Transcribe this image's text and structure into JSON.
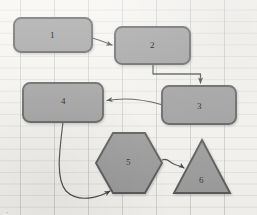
{
  "diagram": {
    "background": {
      "paper_color": "#f6f5f1",
      "grid_major_color": "#7887 96",
      "grid_vertical_spacing_px": 34,
      "grid_horizontal_spacing_px": 11.6
    },
    "style": {
      "shape_fill": "#9a9a9a",
      "shape_stroke": "#575757",
      "connector_stroke": "#4a4a4a",
      "label_color": "#2f2f2f"
    },
    "nodes": [
      {
        "id": "n1",
        "label": "1",
        "shape": "rounded-rectangle",
        "x": 14,
        "y": 18,
        "w": 78,
        "h": 34
      },
      {
        "id": "n2",
        "label": "2",
        "shape": "rounded-rectangle",
        "x": 115,
        "y": 27,
        "w": 75,
        "h": 37
      },
      {
        "id": "n3",
        "label": "3",
        "shape": "rounded-rectangle",
        "x": 162,
        "y": 86,
        "w": 74,
        "h": 38
      },
      {
        "id": "n4",
        "label": "4",
        "shape": "rounded-rectangle",
        "x": 23,
        "y": 83,
        "w": 80,
        "h": 39
      },
      {
        "id": "n5",
        "label": "5",
        "shape": "hexagon",
        "x": 96,
        "y": 133,
        "w": 66,
        "h": 60
      },
      {
        "id": "n6",
        "label": "6",
        "shape": "triangle",
        "x": 174,
        "y": 140,
        "w": 56,
        "h": 53
      }
    ],
    "edges": [
      {
        "id": "e1",
        "from": "n1",
        "to": "n2",
        "kind": "straight-arrow"
      },
      {
        "id": "e2",
        "from": "n2",
        "to": "n3",
        "kind": "elbow-arrow"
      },
      {
        "id": "e3",
        "from": "n3",
        "to": "n4",
        "kind": "curved-arrow"
      },
      {
        "id": "e4",
        "from": "n4",
        "to": "n5",
        "kind": "long-curved-arrow"
      },
      {
        "id": "e5",
        "from": "n5",
        "to": "n6",
        "kind": "wavy-arrow"
      }
    ],
    "footer_text": "."
  }
}
